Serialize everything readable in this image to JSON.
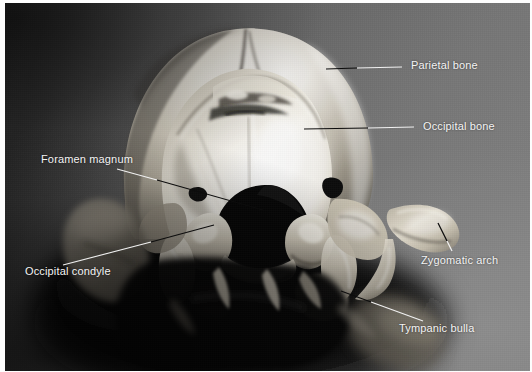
{
  "figure": {
    "modality": "black-and-white photograph",
    "background_color": "#5e5e5e",
    "label_color": "#f4f4f4",
    "leader_dark_color": "#101010",
    "leader_light_color": "#efefef",
    "plate_border_color": "#fdfdfd"
  },
  "labels": [
    {
      "id": "parietal-bone",
      "text": "Parietal bone",
      "text_x": 406,
      "text_y": 60,
      "leader": {
        "x1": 326,
        "y1": 68,
        "x2": 402,
        "y2": 65,
        "style": "split"
      }
    },
    {
      "id": "occipital-bone",
      "text": "Occipital bone",
      "text_x": 418,
      "text_y": 121,
      "leader": {
        "x1": 304,
        "y1": 127,
        "x2": 414,
        "y2": 126,
        "style": "split"
      }
    },
    {
      "id": "foramen-magnum",
      "text": "Foramen magnum",
      "text_x": 36,
      "text_y": 153,
      "leader": {
        "x1": 118,
        "y1": 168,
        "x2": 262,
        "y2": 209,
        "style": "dark"
      }
    },
    {
      "id": "occipital-condyle",
      "text": "Occipital condyle",
      "text_x": 20,
      "text_y": 265,
      "leader": {
        "x1": 62,
        "y1": 263,
        "x2": 212,
        "y2": 223,
        "style": "light-dark"
      }
    },
    {
      "id": "zygomatic-arch",
      "text": "Zygomatic arch",
      "text_x": 416,
      "text_y": 254,
      "leader": {
        "x1": 434,
        "y1": 221,
        "x2": 448,
        "y2": 249,
        "style": "dark"
      }
    },
    {
      "id": "tympanic-bulla",
      "text": "Tympanic bulla",
      "text_x": 394,
      "text_y": 322,
      "leader": {
        "x1": 340,
        "y1": 289,
        "x2": 420,
        "y2": 318,
        "style": "dark-light"
      }
    }
  ]
}
